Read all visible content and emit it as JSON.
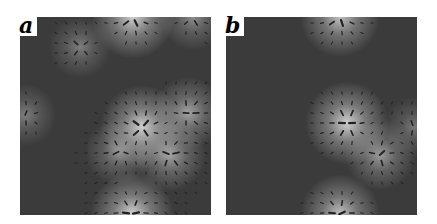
{
  "figure": {
    "panels": [
      {
        "label": "a",
        "bounds": {
          "x": 20,
          "y": 17,
          "w": 191,
          "h": 198
        },
        "sources": [
          {
            "x": 113,
            "y": 0,
            "strength": 1.0
          },
          {
            "x": 173,
            "y": 0,
            "strength": 0.55
          },
          {
            "x": 60,
            "y": 30,
            "strength": 0.45
          },
          {
            "x": 168,
            "y": 96,
            "strength": 0.7
          },
          {
            "x": 122,
            "y": 110,
            "strength": 1.0
          },
          {
            "x": 150,
            "y": 138,
            "strength": 0.7
          },
          {
            "x": 98,
            "y": 135,
            "strength": 0.55
          },
          {
            "x": 112,
            "y": 197,
            "strength": 1.0
          },
          {
            "x": 5,
            "y": 98,
            "strength": 0.45
          }
        ]
      },
      {
        "label": "b",
        "bounds": {
          "x": 226,
          "y": 17,
          "w": 191,
          "h": 198
        },
        "sources": [
          {
            "x": 114,
            "y": 0,
            "strength": 0.9
          },
          {
            "x": 121,
            "y": 106,
            "strength": 1.0
          },
          {
            "x": 154,
            "y": 138,
            "strength": 0.65
          },
          {
            "x": 114,
            "y": 197,
            "strength": 0.9
          },
          {
            "x": 188,
            "y": 110,
            "strength": 0.4
          }
        ]
      }
    ],
    "colors": {
      "background": "#3b3b3b",
      "glow": "#e8e8e8",
      "arrow": "#222222",
      "label_bg": "#ffffff",
      "label_text": "#000000"
    }
  }
}
